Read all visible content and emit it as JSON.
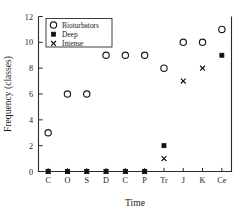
{
  "chart_data": {
    "type": "scatter",
    "title": "",
    "xlabel": "Time",
    "ylabel": "Frequency (classes)",
    "categories": [
      "C",
      "O",
      "S",
      "D",
      "C",
      "P",
      "Tr",
      "J",
      "K",
      "Ce"
    ],
    "ylim": [
      0,
      12
    ],
    "yticks": [
      0,
      2,
      4,
      6,
      8,
      10,
      12
    ],
    "ytick_labels": [
      "0",
      "2",
      "4",
      "6",
      "8",
      "10",
      "12"
    ],
    "grid": false,
    "legend_position": "top-left",
    "series": [
      {
        "name": "Bioturbators",
        "marker": "open-circle",
        "color": "#1a1a1a",
        "values": [
          3,
          6,
          6,
          9,
          9,
          9,
          8,
          10,
          10,
          11
        ]
      },
      {
        "name": "Deep",
        "marker": "filled-square",
        "color": "#111111",
        "values": [
          0,
          0,
          0,
          0,
          0,
          0,
          2,
          null,
          null,
          9
        ]
      },
      {
        "name": "Intense",
        "marker": "x-marker",
        "color": "#111111",
        "values": [
          0,
          0,
          0,
          0,
          0,
          0,
          1,
          7,
          8,
          null
        ]
      }
    ]
  },
  "legend": {
    "entries": [
      {
        "label": "Bioturbators",
        "marker": "open-circle"
      },
      {
        "label": "Deep",
        "marker": "filled-square"
      },
      {
        "label": "Intense",
        "marker": "x-marker"
      }
    ]
  },
  "axes": {
    "x_title": "Time",
    "y_title": "Frequency (classes)"
  }
}
